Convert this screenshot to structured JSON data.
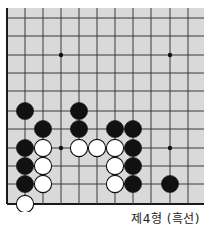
{
  "diagram": {
    "caption": "제4형 (흑선)",
    "board_color": "#d9d9d9",
    "line_color": "#3a3a3a",
    "edge_color": "#1a1a1a",
    "black_color": "#111111",
    "white_color": "#ffffff",
    "columns_x": [
      7,
      25,
      43,
      61,
      79,
      97,
      115,
      133,
      151,
      170,
      188
    ],
    "rows_y": [
      18,
      36,
      55,
      73,
      91,
      111,
      129,
      148,
      166,
      184,
      204
    ],
    "star_points": [
      [
        3,
        2
      ],
      [
        9,
        2
      ],
      [
        3,
        7
      ],
      [
        9,
        7
      ]
    ],
    "stones": [
      {
        "color": "black",
        "col": 1,
        "row": 5
      },
      {
        "color": "black",
        "col": 4,
        "row": 5
      },
      {
        "color": "black",
        "col": 2,
        "row": 6
      },
      {
        "color": "black",
        "col": 4,
        "row": 6
      },
      {
        "color": "black",
        "col": 6,
        "row": 6
      },
      {
        "color": "black",
        "col": 7,
        "row": 6
      },
      {
        "color": "black",
        "col": 1,
        "row": 7
      },
      {
        "color": "white",
        "col": 2,
        "row": 7
      },
      {
        "color": "white",
        "col": 4,
        "row": 7
      },
      {
        "color": "white",
        "col": 5,
        "row": 7
      },
      {
        "color": "white",
        "col": 6,
        "row": 7
      },
      {
        "color": "black",
        "col": 7,
        "row": 7
      },
      {
        "color": "black",
        "col": 1,
        "row": 8
      },
      {
        "color": "white",
        "col": 2,
        "row": 8
      },
      {
        "color": "white",
        "col": 6,
        "row": 8
      },
      {
        "color": "black",
        "col": 7,
        "row": 8
      },
      {
        "color": "black",
        "col": 1,
        "row": 9
      },
      {
        "color": "white",
        "col": 2,
        "row": 9
      },
      {
        "color": "white",
        "col": 6,
        "row": 9
      },
      {
        "color": "black",
        "col": 7,
        "row": 9
      },
      {
        "color": "black",
        "col": 9,
        "row": 9
      },
      {
        "color": "white",
        "col": 1,
        "row": 10
      }
    ]
  }
}
